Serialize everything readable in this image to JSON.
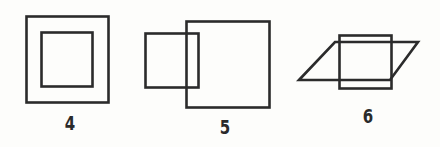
{
  "figures": [
    {
      "id": 4,
      "label": "4",
      "description": "Small square fully inside larger square (concentric)",
      "shapes": [
        "outer-square",
        "inner-square"
      ]
    },
    {
      "id": 5,
      "label": "5",
      "description": "Small square partially overlapping larger square",
      "shapes": [
        "large-square",
        "small-square"
      ]
    },
    {
      "id": 6,
      "label": "6",
      "description": "Square overlapping a parallelogram",
      "shapes": [
        "square",
        "parallelogram"
      ]
    }
  ],
  "colors": {
    "stroke": "#2b2b2b",
    "background": "#fdfdfb"
  }
}
